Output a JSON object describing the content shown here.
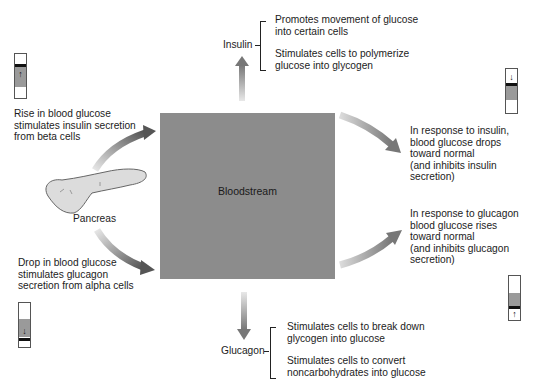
{
  "diagram": {
    "center": {
      "label": "Bloodstream",
      "color": "#8c8c8c"
    },
    "organ": {
      "label": "Pancreas"
    },
    "left_top": {
      "lines": [
        "Rise in blood glucose",
        "stimulates insulin secretion",
        "from beta cells"
      ],
      "indicator": {
        "direction": "up",
        "glyph": "↑"
      }
    },
    "left_bottom": {
      "lines": [
        "Drop in blood glucose",
        "stimulates glucagon",
        "secretion from alpha cells"
      ],
      "indicator": {
        "direction": "down",
        "glyph": "↓"
      }
    },
    "insulin": {
      "label": "Insulin",
      "effects": [
        {
          "lines": [
            "Promotes movement of glucose",
            "into certain cells"
          ]
        },
        {
          "lines": [
            "Stimulates cells to polymerize",
            "glucose into glycogen"
          ]
        }
      ]
    },
    "glucagon": {
      "label": "Glucagon",
      "effects": [
        {
          "lines": [
            "Stimulates cells to break down",
            "glycogen into glucose"
          ]
        },
        {
          "lines": [
            "Stimulates cells to convert",
            "noncarbohydrates into glucose"
          ]
        }
      ]
    },
    "right_top": {
      "lines": [
        "In response to insulin,",
        "blood glucose drops",
        "toward normal",
        "(and inhibits insulin",
        "secretion)"
      ],
      "indicator": {
        "direction": "down",
        "glyph": "↓"
      }
    },
    "right_bottom": {
      "lines": [
        "In response to glucagon",
        "blood glucose rises",
        "toward normal",
        "(and inhibits glucagon",
        "secretion)"
      ],
      "indicator": {
        "direction": "up",
        "glyph": "↑"
      }
    },
    "colors": {
      "arrow_dark": "#5a5a5a",
      "arrow_light": "#d8d8d8",
      "indicator_fill": "#9a9a9a"
    }
  }
}
